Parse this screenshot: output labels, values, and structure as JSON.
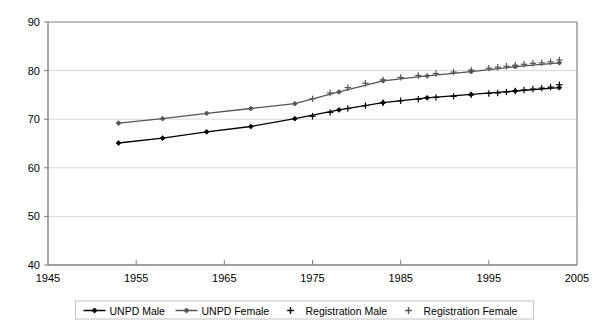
{
  "chart_data": {
    "type": "line",
    "title": "",
    "subtitle": "",
    "xlabel": "",
    "ylabel": "",
    "xlim": [
      1945,
      2005
    ],
    "ylim": [
      40,
      90
    ],
    "xticks": [
      1945,
      1955,
      1965,
      1975,
      1985,
      1995,
      2005
    ],
    "yticks": [
      40,
      50,
      60,
      70,
      80,
      90
    ],
    "grid": "horizontal",
    "legend_position": "bottom",
    "series": [
      {
        "name": "UNPD Male",
        "marker": "diamond",
        "color": "#000000",
        "x": [
          1953,
          1958,
          1963,
          1968,
          1973,
          1978,
          1983,
          1988,
          1993,
          1998,
          2003
        ],
        "values": [
          65.1,
          66.1,
          67.4,
          68.5,
          70.1,
          71.9,
          73.4,
          74.4,
          75.1,
          75.8,
          76.5
        ]
      },
      {
        "name": "UNPD Female",
        "marker": "diamond",
        "color": "#555555",
        "x": [
          1953,
          1958,
          1963,
          1968,
          1973,
          1978,
          1983,
          1988,
          1993,
          1998,
          2003
        ],
        "values": [
          69.2,
          70.1,
          71.2,
          72.2,
          73.2,
          75.6,
          77.9,
          78.9,
          79.8,
          80.8,
          81.6
        ]
      },
      {
        "name": "Registration Male",
        "marker": "plus",
        "color": "#000000",
        "x": [
          1975,
          1977,
          1979,
          1981,
          1983,
          1985,
          1987,
          1989,
          1991,
          1993,
          1995,
          1996,
          1997,
          1998,
          1999,
          2000,
          2001,
          2002,
          2003
        ],
        "values": [
          70.6,
          71.4,
          72.2,
          72.8,
          73.4,
          73.8,
          74.1,
          74.5,
          74.7,
          75.0,
          75.3,
          75.4,
          75.6,
          75.8,
          76.0,
          76.2,
          76.4,
          76.6,
          77.1
        ]
      },
      {
        "name": "Registration Female",
        "marker": "plus",
        "color": "#555555",
        "x": [
          1975,
          1977,
          1979,
          1981,
          1983,
          1985,
          1987,
          1989,
          1991,
          1993,
          1995,
          1996,
          1997,
          1998,
          1999,
          2000,
          2001,
          2002,
          2003
        ],
        "values": [
          74.2,
          75.4,
          76.5,
          77.4,
          78.1,
          78.6,
          79.0,
          79.4,
          79.7,
          80.1,
          80.5,
          80.7,
          80.9,
          81.1,
          81.3,
          81.5,
          81.6,
          81.8,
          82.2
        ]
      }
    ]
  },
  "axes": {
    "x_tick_labels": [
      "1945",
      "1955",
      "1965",
      "1975",
      "1985",
      "1995",
      "2005"
    ],
    "y_tick_labels": [
      "40",
      "50",
      "60",
      "70",
      "80",
      "90"
    ]
  },
  "legend": {
    "items": [
      {
        "label": "UNPD Male",
        "marker": "line-diamond",
        "color": "#000000"
      },
      {
        "label": "UNPD Female",
        "marker": "line-diamond",
        "color": "#555555"
      },
      {
        "label": "Registration Male",
        "marker": "plus",
        "color": "#000000"
      },
      {
        "label": "Registration Female",
        "marker": "plus",
        "color": "#555555"
      }
    ]
  },
  "colors": {
    "axis": "#808080",
    "grid": "#d9d9d9",
    "male": "#000000",
    "female": "#555555",
    "background": "#ffffff"
  }
}
